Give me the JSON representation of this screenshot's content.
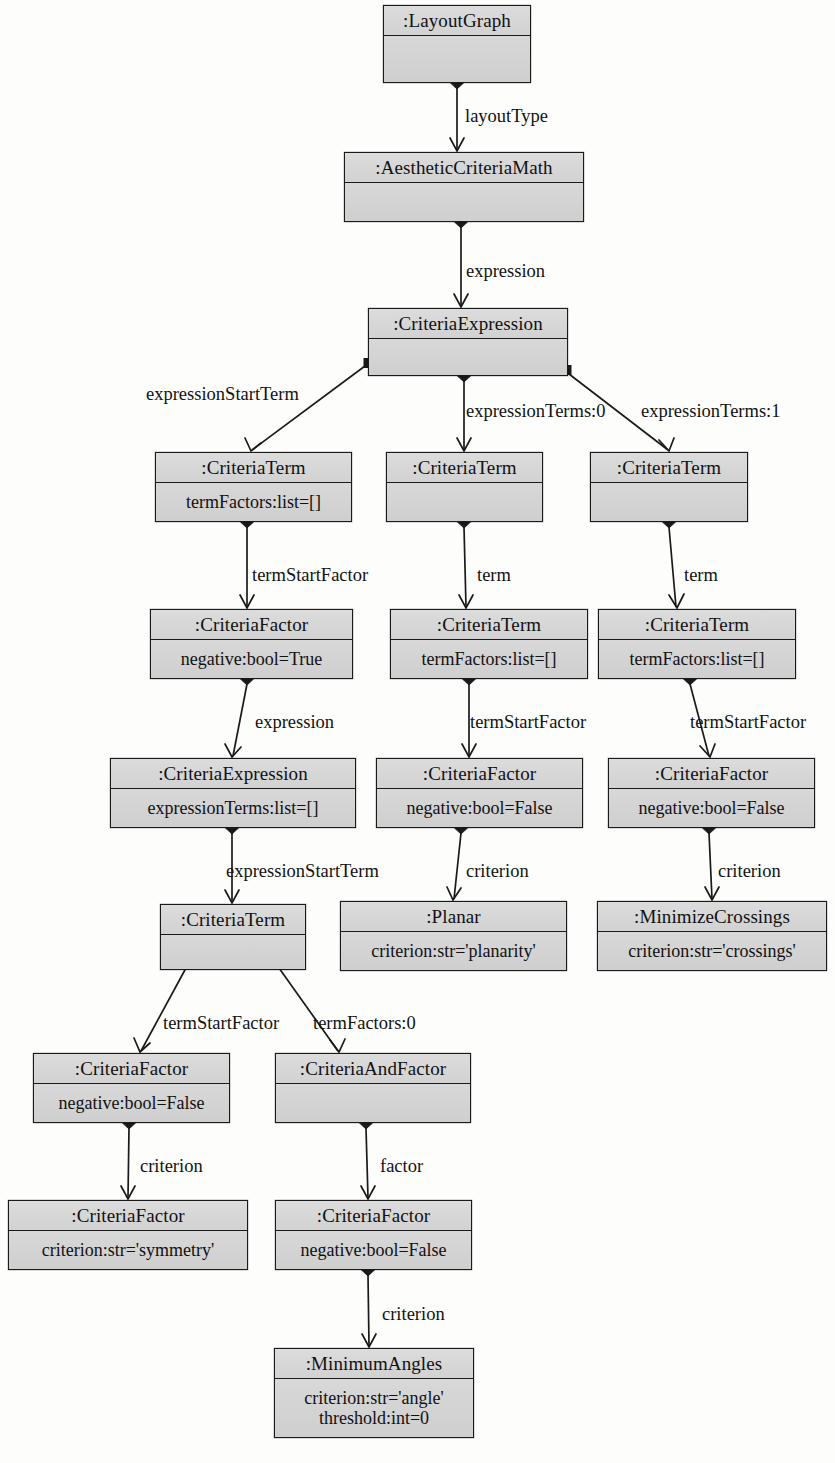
{
  "diagram": {
    "type": "uml-object-diagram",
    "width": 835,
    "height": 1463,
    "background_color": "#fdfdfc",
    "box_fill_color": "#d6d6d6",
    "line_color": "#1a1a1a"
  },
  "nodes": [
    {
      "id": "layoutgraph",
      "title": ":LayoutGraph",
      "attrs": [],
      "x": 383,
      "y": 5,
      "w": 148,
      "h": 78
    },
    {
      "id": "aestheticcriteriamath",
      "title": ":AestheticCriteriaMath",
      "attrs": [],
      "x": 344,
      "y": 152,
      "w": 240,
      "h": 70
    },
    {
      "id": "criteriaexpression-root",
      "title": ":CriteriaExpression",
      "attrs": [],
      "x": 368,
      "y": 308,
      "w": 200,
      "h": 68
    },
    {
      "id": "criteriaterm-left",
      "title": ":CriteriaTerm",
      "attrs": [
        "termFactors:list=[]"
      ],
      "x": 155,
      "y": 452,
      "w": 197,
      "h": 70
    },
    {
      "id": "criteriaterm-mid",
      "title": ":CriteriaTerm",
      "attrs": [],
      "x": 386,
      "y": 452,
      "w": 157,
      "h": 70
    },
    {
      "id": "criteriaterm-right",
      "title": ":CriteriaTerm",
      "attrs": [],
      "x": 590,
      "y": 452,
      "w": 158,
      "h": 70
    },
    {
      "id": "criteriafactor-true",
      "title": ":CriteriaFactor",
      "attrs": [
        "negative:bool=True"
      ],
      "x": 150,
      "y": 609,
      "w": 203,
      "h": 70
    },
    {
      "id": "criteriaterm-mid2",
      "title": ":CriteriaTerm",
      "attrs": [
        "termFactors:list=[]"
      ],
      "x": 390,
      "y": 609,
      "w": 198,
      "h": 70
    },
    {
      "id": "criteriaterm-right2",
      "title": ":CriteriaTerm",
      "attrs": [
        "termFactors:list=[]"
      ],
      "x": 598,
      "y": 609,
      "w": 198,
      "h": 70
    },
    {
      "id": "criteriaexpression-nested",
      "title": ":CriteriaExpression",
      "attrs": [
        "expressionTerms:list=[]"
      ],
      "x": 110,
      "y": 758,
      "w": 246,
      "h": 70
    },
    {
      "id": "criteriafactor-false-mid",
      "title": ":CriteriaFactor",
      "attrs": [
        "negative:bool=False"
      ],
      "x": 376,
      "y": 758,
      "w": 207,
      "h": 70
    },
    {
      "id": "criteriafactor-false-right",
      "title": ":CriteriaFactor",
      "attrs": [
        "negative:bool=False"
      ],
      "x": 608,
      "y": 758,
      "w": 207,
      "h": 70
    },
    {
      "id": "criteriaterm-lower",
      "title": ":CriteriaTerm",
      "attrs": [],
      "x": 160,
      "y": 904,
      "w": 146,
      "h": 66
    },
    {
      "id": "planar",
      "title": ":Planar",
      "attrs": [
        "criterion:str='planarity'"
      ],
      "x": 340,
      "y": 901,
      "w": 227,
      "h": 70
    },
    {
      "id": "minimizecrossings",
      "title": ":MinimizeCrossings",
      "attrs": [
        "criterion:str='crossings'"
      ],
      "x": 597,
      "y": 901,
      "w": 230,
      "h": 70
    },
    {
      "id": "criteriafactor-false-bl",
      "title": ":CriteriaFactor",
      "attrs": [
        "negative:bool=False"
      ],
      "x": 33,
      "y": 1053,
      "w": 197,
      "h": 70
    },
    {
      "id": "criteriaandfactor",
      "title": ":CriteriaAndFactor",
      "attrs": [],
      "x": 275,
      "y": 1053,
      "w": 196,
      "h": 70
    },
    {
      "id": "criteriafactor-symmetry",
      "title": ":CriteriaFactor",
      "attrs": [
        "criterion:str='symmetry'"
      ],
      "x": 8,
      "y": 1200,
      "w": 240,
      "h": 70
    },
    {
      "id": "criteriafactor-false-bottom",
      "title": ":CriteriaFactor",
      "attrs": [
        "negative:bool=False"
      ],
      "x": 275,
      "y": 1200,
      "w": 197,
      "h": 70
    },
    {
      "id": "minimumangles",
      "title": ":MinimumAngles",
      "attrs": [
        "criterion:str='angle'",
        "threshold:int=0"
      ],
      "x": 274,
      "y": 1348,
      "w": 200,
      "h": 90
    }
  ],
  "edges": [
    {
      "id": "e-layouttype",
      "label": "layoutType",
      "from": "layoutgraph",
      "to": "aestheticcriteriamath",
      "label_x": 465,
      "label_y": 107,
      "diamond": {
        "x": 457,
        "y": 83
      },
      "path": "M 457 88 L 457 150",
      "arrow": "M 450 138 L 457 151 L 464 138"
    },
    {
      "id": "e-expression-root",
      "label": "expression",
      "from": "aestheticcriteriamath",
      "to": "criteriaexpression-root",
      "label_x": 466,
      "label_y": 262,
      "diamond": {
        "x": 461,
        "y": 222
      },
      "path": "M 461 227 L 461 306",
      "arrow": "M 454 294 L 461 307 L 468 294"
    },
    {
      "id": "e-expressionstartterm-1",
      "label": "expressionStartTerm",
      "from": "criteriaexpression-root",
      "to": "criteriaterm-left",
      "label_x": 146,
      "label_y": 385,
      "square": {
        "x": 369,
        "y": 363
      },
      "path": "M 365 366 L 252 450",
      "arrow": "M 245 438 L 251 451 L 261 443"
    },
    {
      "id": "e-expressionterms-0",
      "label": "expressionTerms:0",
      "from": "criteriaexpression-root",
      "to": "criteriaterm-mid",
      "label_x": 466,
      "label_y": 402,
      "diamond": {
        "x": 464,
        "y": 376
      },
      "path": "M 464 381 L 464 450",
      "arrow": "M 457 438 L 464 451 L 471 438"
    },
    {
      "id": "e-expressionterms-1",
      "label": "expressionTerms:1",
      "from": "criteriaexpression-root",
      "to": "criteriaterm-right",
      "label_x": 641,
      "label_y": 402,
      "square": {
        "x": 566,
        "y": 370
      },
      "path": "M 569 374 L 668 450",
      "arrow": "M 659 440 L 669 451 L 674 438"
    },
    {
      "id": "e-termstartfactor-1",
      "label": "termStartFactor",
      "from": "criteriaterm-left",
      "to": "criteriafactor-true",
      "label_x": 252,
      "label_y": 566,
      "diamond": {
        "x": 247,
        "y": 522
      },
      "path": "M 247 527 L 247 607",
      "arrow": "M 240 595 L 247 608 L 254 595"
    },
    {
      "id": "e-term-mid",
      "label": "term",
      "from": "criteriaterm-mid",
      "to": "criteriaterm-mid2",
      "label_x": 477,
      "label_y": 566,
      "diamond": {
        "x": 464,
        "y": 522
      },
      "path": "M 464 527 L 466 607",
      "arrow": "M 459 595 L 466 608 L 473 595"
    },
    {
      "id": "e-term-right",
      "label": "term",
      "from": "criteriaterm-right",
      "to": "criteriaterm-right2",
      "label_x": 684,
      "label_y": 566,
      "diamond": {
        "x": 669,
        "y": 522
      },
      "path": "M 669 527 L 676 607",
      "arrow": "M 669 595 L 677 608 L 684 594"
    },
    {
      "id": "e-expression-nested",
      "label": "expression",
      "from": "criteriafactor-true",
      "to": "criteriaexpression-nested",
      "label_x": 255,
      "label_y": 713,
      "diamond": {
        "x": 247,
        "y": 679
      },
      "path": "M 247 684 L 233 756",
      "arrow": "M 225 744 L 232 757 L 241 747"
    },
    {
      "id": "e-termstartfactor-mid",
      "label": "termStartFactor",
      "from": "criteriaterm-mid2",
      "to": "criteriafactor-false-mid",
      "label_x": 470,
      "label_y": 713,
      "diamond": {
        "x": 469,
        "y": 679
      },
      "path": "M 469 684 L 469 756",
      "arrow": "M 462 744 L 469 757 L 476 744"
    },
    {
      "id": "e-termstartfactor-right",
      "label": "termStartFactor",
      "from": "criteriaterm-right2",
      "to": "criteriafactor-false-right",
      "label_x": 690,
      "label_y": 713,
      "diamond": {
        "x": 690,
        "y": 679
      },
      "path": "M 690 684 L 709 756",
      "arrow": "M 700 746 L 710 757 L 715 744"
    },
    {
      "id": "e-expressionstartterm-2",
      "label": "expressionStartTerm",
      "from": "criteriaexpression-nested",
      "to": "criteriaterm-lower",
      "label_x": 226,
      "label_y": 862,
      "diamond": {
        "x": 232,
        "y": 828
      },
      "path": "M 232 833 L 232 902",
      "arrow": "M 225 890 L 232 903 L 239 890"
    },
    {
      "id": "e-criterion-planar",
      "label": "criterion",
      "from": "criteriafactor-false-mid",
      "to": "planar",
      "label_x": 466,
      "label_y": 862,
      "diamond": {
        "x": 461,
        "y": 828
      },
      "path": "M 461 833 L 454 899",
      "arrow": "M 447 887 L 453 900 L 461 888"
    },
    {
      "id": "e-criterion-crossings",
      "label": "criterion",
      "from": "criteriafactor-false-right",
      "to": "minimizecrossings",
      "label_x": 718,
      "label_y": 862,
      "diamond": {
        "x": 709,
        "y": 828
      },
      "path": "M 709 833 L 712 899",
      "arrow": "M 705 887 L 712 900 L 719 887"
    },
    {
      "id": "e-termstartfactor-bl",
      "label": "termStartFactor",
      "from": "criteriaterm-lower",
      "to": "criteriafactor-false-bl",
      "label_x": 163,
      "label_y": 1014,
      "square": {
        "x": 186,
        "y": 963
      },
      "path": "M 186 968 L 141 1051",
      "arrow": "M 134 1038 L 140 1052 L 150 1043"
    },
    {
      "id": "e-termfactors-0",
      "label": "termFactors:0",
      "from": "criteriaterm-lower",
      "to": "criteriaandfactor",
      "label_x": 313,
      "label_y": 1014,
      "square": {
        "x": 277,
        "y": 963
      },
      "path": "M 279 968 L 338 1051",
      "arrow": "M 330 1040 L 339 1052 L 345 1039"
    },
    {
      "id": "e-criterion-symmetry",
      "label": "criterion",
      "from": "criteriafactor-false-bl",
      "to": "criteriafactor-symmetry",
      "label_x": 140,
      "label_y": 1157,
      "diamond": {
        "x": 129,
        "y": 1123
      },
      "path": "M 129 1128 L 128 1198",
      "arrow": "M 121 1186 L 128 1199 L 135 1186"
    },
    {
      "id": "e-factor",
      "label": "factor",
      "from": "criteriaandfactor",
      "to": "criteriafactor-false-bottom",
      "label_x": 380,
      "label_y": 1157,
      "diamond": {
        "x": 366,
        "y": 1123
      },
      "path": "M 366 1128 L 368 1198",
      "arrow": "M 361 1186 L 368 1199 L 375 1186"
    },
    {
      "id": "e-criterion-angle",
      "label": "criterion",
      "from": "criteriafactor-false-bottom",
      "to": "minimumangles",
      "label_x": 382,
      "label_y": 1305,
      "diamond": {
        "x": 368,
        "y": 1270
      },
      "path": "M 368 1275 L 369 1346",
      "arrow": "M 362 1334 L 369 1347 L 376 1334"
    }
  ],
  "footer": {
    "partial_caption": "Figure: Object diagram structure"
  }
}
